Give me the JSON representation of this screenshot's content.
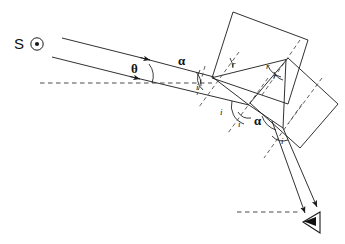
{
  "diagram": {
    "type": "optics-ray-diagram",
    "canvas": {
      "width": 345,
      "height": 244,
      "background": "#ffffff"
    },
    "stroke_color": "#1a1a1a",
    "dash_color": "#333333"
  },
  "labels": {
    "source": "S",
    "deviation_angle": "θ",
    "alpha_top": "α",
    "alpha_bottom": "α",
    "incidence_1": "i",
    "incidence_2": "i",
    "incidence_3": "i",
    "incidence_4": "i",
    "refraction_1": "r",
    "refraction_2": "r",
    "refraction_3": "r"
  },
  "icons": {
    "sun_source": "circled-dot-icon",
    "eye": "eye-icon",
    "arrowhead": "arrow-icon"
  },
  "geometry": {
    "incident_rays": [
      {
        "name": "upper-incident-ray",
        "x1": 62,
        "y1": 38,
        "x2": 214,
        "y2": 76
      },
      {
        "name": "lower-incident-ray",
        "x1": 52,
        "y1": 57,
        "x2": 248,
        "y2": 105
      }
    ],
    "horizontal_reference_top": {
      "x1": 40,
      "y1": 83,
      "x2": 212,
      "y2": 83
    },
    "horizontal_reference_bottom": {
      "x1": 237,
      "y1": 212,
      "x2": 300,
      "y2": 212
    },
    "slab_upper": [
      [
        212,
        78
      ],
      [
        233,
        12
      ],
      [
        308,
        40
      ],
      [
        288,
        104
      ]
    ],
    "slab_lower": [
      [
        250,
        103
      ],
      [
        288,
        58
      ],
      [
        338,
        104
      ],
      [
        300,
        148
      ]
    ],
    "exit_rays": [
      {
        "name": "exit-ray-left",
        "x1": 272,
        "y1": 122,
        "x2": 305,
        "y2": 213
      },
      {
        "name": "exit-ray-right",
        "x1": 283,
        "y1": 128,
        "x2": 316,
        "y2": 208
      }
    ],
    "eye_position": {
      "x": 312,
      "y": 222
    }
  }
}
